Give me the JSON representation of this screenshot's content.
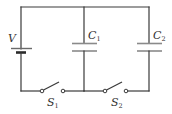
{
  "diagram": {
    "type": "circuit-schematic",
    "colors": {
      "background": "#ffffff",
      "wire": "#3a3a3a",
      "plate": "#8a8a8a",
      "text": "#333333"
    },
    "components": {
      "battery": {
        "label": "V"
      },
      "capacitor_1": {
        "label": "C",
        "subscript": "1"
      },
      "capacitor_2": {
        "label": "C",
        "subscript": "2"
      },
      "switch_1": {
        "label": "S",
        "subscript": "1",
        "state": "open"
      },
      "switch_2": {
        "label": "S",
        "subscript": "2",
        "state": "open"
      }
    }
  }
}
